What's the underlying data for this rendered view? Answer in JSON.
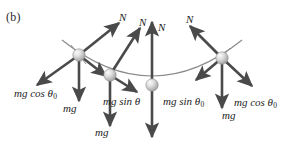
{
  "figure": {
    "panel_label": "(b)",
    "caption_absent": true,
    "colors": {
      "arrow": "#4a4a4a",
      "wire": "#8a8a8a",
      "bead_light": "#f2f2f2",
      "bead_mid": "#b9b9b9",
      "bead_dark": "#8f8f8f",
      "text": "#1c1c1c",
      "background": "#ffffff"
    },
    "normal_force_labels": [
      {
        "id": "n-1",
        "text": "N"
      },
      {
        "id": "n-2",
        "text": "N"
      },
      {
        "id": "n-3",
        "text": "N"
      },
      {
        "id": "n-4",
        "text": "N"
      }
    ],
    "weight_labels": [
      {
        "id": "mg-1",
        "text": "mg"
      },
      {
        "id": "mg-2",
        "text": "mg"
      },
      {
        "id": "mg-3",
        "text": "mg"
      },
      {
        "id": "mg-4",
        "text": "mg"
      }
    ],
    "component_labels": [
      {
        "id": "comp-left-cos",
        "prefix": "mg cos ",
        "symbol": "θ",
        "sub": "0"
      },
      {
        "id": "comp-mid-sin",
        "prefix": "mg sin ",
        "symbol": "θ",
        "sub": ""
      },
      {
        "id": "comp-right-sin",
        "prefix": "mg sin ",
        "symbol": "θ",
        "sub": "0"
      },
      {
        "id": "comp-right-cos",
        "prefix": "mg cos ",
        "symbol": "θ",
        "sub": "0"
      }
    ],
    "beads": [
      {
        "id": "bead-1",
        "cx": 79,
        "cy": 55
      },
      {
        "id": "bead-2",
        "cx": 110,
        "cy": 75
      },
      {
        "id": "bead-3",
        "cx": 152,
        "cy": 85
      },
      {
        "id": "bead-4",
        "cx": 222,
        "cy": 58
      }
    ]
  }
}
